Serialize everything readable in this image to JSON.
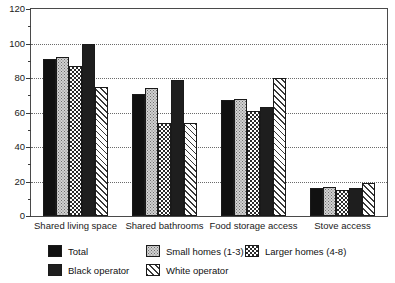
{
  "chart_data": {
    "type": "bar",
    "title": "",
    "xlabel": "",
    "ylabel": "",
    "ylim": [
      0,
      120
    ],
    "yticks": [
      0,
      20,
      40,
      60,
      80,
      100,
      120
    ],
    "ytick_labels": [
      "0",
      "20",
      "40",
      "60",
      "80",
      "100",
      "120"
    ],
    "minor_tick_step": 10,
    "grid": "horizontal-dotted",
    "legend_position": "bottom",
    "categories": [
      "Shared living space",
      "Shared bathrooms",
      "Food storage access",
      "Stove access"
    ],
    "series": [
      {
        "name": "Total",
        "pattern": "solid-black",
        "values": [
          91,
          71,
          67,
          16
        ]
      },
      {
        "name": "Small homes (1-3)",
        "pattern": "light-stipple",
        "values": [
          92,
          74,
          68,
          17
        ]
      },
      {
        "name": "Larger homes (4-8)",
        "pattern": "checkerboard",
        "values": [
          87,
          54,
          61,
          15
        ]
      },
      {
        "name": "Black operator",
        "pattern": "solid-dark",
        "values": [
          100,
          79,
          63,
          16
        ]
      },
      {
        "name": "White operator",
        "pattern": "diagonal-hatch",
        "values": [
          75,
          54,
          80,
          19
        ]
      }
    ]
  },
  "legend": {
    "items": [
      {
        "label": "Total"
      },
      {
        "label": "Small homes (1-3)"
      },
      {
        "label": "Larger homes (4-8)"
      },
      {
        "label": "Black operator"
      },
      {
        "label": "White operator"
      }
    ]
  },
  "colors": {
    "axis": "#4a4a4a",
    "grid": "#6b6b6b",
    "bar_outline": "#1a1a1a",
    "background": "#ffffff"
  }
}
